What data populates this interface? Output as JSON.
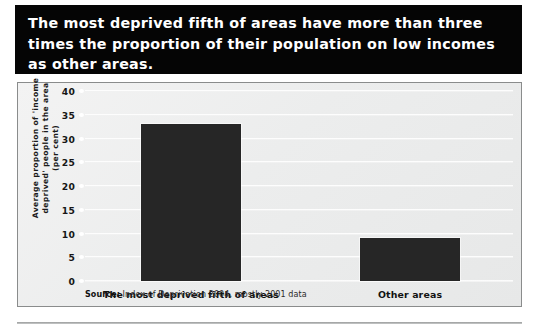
{
  "title": "The most deprived fifth of areas have more than three\ntimes the proportion of their population on low incomes\nas other areas.",
  "source": {
    "keyword": "Source:",
    "rest": " Index of Deprivation 2004, mostly 2001 data"
  },
  "colors": {
    "banner_background": "#050505",
    "banner_text": "#ffffff",
    "bar_fill": "#262626",
    "panel_background": "#eceded",
    "panel_border": "#8a8c8c",
    "gridline": "#fdfdfd"
  },
  "chart_data": {
    "type": "bar",
    "title": "The most deprived fifth of areas have more than three times the proportion of their population on low incomes as other areas.",
    "categories": [
      "The most deprived fifth of areas",
      "Other areas"
    ],
    "values": [
      33,
      9
    ],
    "xlabel": "",
    "ylabel": "Average proportion of 'income deprived' people in the area (per cent)",
    "ylim": [
      0,
      40
    ],
    "yticks": [
      0,
      5,
      10,
      15,
      20,
      25,
      30,
      35,
      40
    ],
    "ytick_labels": [
      "0",
      "5",
      "10",
      "15",
      "20",
      "25",
      "30",
      "35",
      "40"
    ],
    "grid": true,
    "legend": false,
    "source": "Source: Index of Deprivation 2004, mostly 2001 data"
  }
}
